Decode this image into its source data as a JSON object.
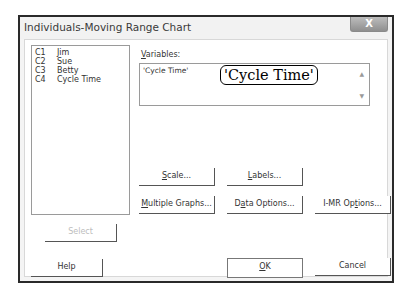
{
  "window": {
    "title": "Individuals-Moving Range Chart",
    "close_label": "X"
  },
  "column_list": {
    "items": [
      {
        "col": "C1",
        "name": "Jim"
      },
      {
        "col": "C2",
        "name": "Sue"
      },
      {
        "col": "C3",
        "name": "Betty"
      },
      {
        "col": "C4",
        "name": "Cycle Time"
      }
    ]
  },
  "variables": {
    "label_accel": "V",
    "label_rest": "ariables:",
    "value": "'Cycle Time'",
    "callout": "'Cycle Time'"
  },
  "buttons": {
    "scale": {
      "accel": "S",
      "rest": "cale..."
    },
    "labels": {
      "accel": "L",
      "rest": "abels..."
    },
    "multiple_graphs": {
      "accel": "M",
      "rest": "ultiple Graphs..."
    },
    "data_options": {
      "pre": "D",
      "accel": "a",
      "rest": "ta Options..."
    },
    "imr_options": {
      "pre": "I-MR Op",
      "accel": "t",
      "rest": "ions..."
    },
    "select": "Select",
    "help": "Help",
    "ok": {
      "accel": "O",
      "rest": "K"
    },
    "cancel": "Cancel"
  }
}
